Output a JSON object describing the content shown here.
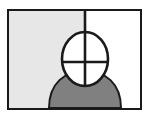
{
  "icon": {
    "title": "person-with-crosshair-head-pictogram",
    "canvas": {
      "width": 149,
      "height": 119,
      "background": "#ffffff"
    },
    "frame": {
      "label": "picture-frame-border",
      "border_color": "#1a1a1a",
      "border_width": 2,
      "x": 7,
      "y": 9,
      "width": 135,
      "height": 101
    },
    "background_panels": [
      {
        "name": "left-panel",
        "label": "Left shaded panel",
        "color": "#e7e7e7",
        "share": "left half"
      },
      {
        "name": "right-panel",
        "label": "Right blank panel",
        "color": "#ffffff",
        "share": "right half"
      }
    ],
    "divider": {
      "label": "vertical-divider-line",
      "color": "#1a1a1a",
      "x": 76,
      "from_y": 0,
      "to_y": 26
    },
    "body": {
      "label": "shoulders-silhouette",
      "fill": "#808080",
      "stroke": "#1a1a1a",
      "stroke_width": 2
    },
    "head": {
      "label": "head-ellipse",
      "fill": "#ffffff",
      "stroke": "#1a1a1a",
      "stroke_width": 2.6,
      "cx": 76,
      "cy": 48,
      "rx": 23,
      "ry": 27
    },
    "crosshair": {
      "label": "crosshair-target-marker",
      "color": "#1a1a1a",
      "stroke_width": 2.6,
      "horizontal": {
        "x1": 54,
        "x2": 99,
        "y": 51
      },
      "vertical": {
        "y1": 20,
        "y2": 76,
        "x": 76
      }
    }
  }
}
